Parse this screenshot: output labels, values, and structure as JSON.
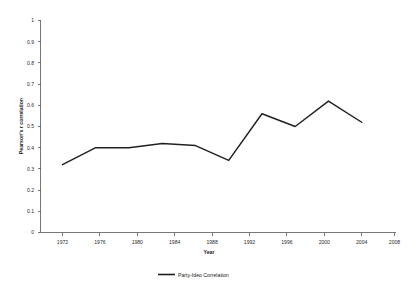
{
  "chart_data": {
    "type": "line",
    "title": "",
    "subtitle": "",
    "xlabel": "Year",
    "ylabel": "Pearson's r correlation",
    "x": [
      1972,
      1976,
      1980,
      1984,
      1988,
      1992,
      1996,
      2000,
      2004,
      2008
    ],
    "xtick_labels": [
      "1972",
      "1976",
      "1980",
      "1984",
      "1988",
      "1992",
      "1996",
      "2000",
      "2004",
      "2008"
    ],
    "ytick_labels": [
      "0",
      "0.1",
      "0.2",
      "0.3",
      "0.4",
      "0.5",
      "0.6",
      "0.7",
      "0.8",
      "0.9",
      "1"
    ],
    "yticks": [
      0,
      0.1,
      0.2,
      0.3,
      0.4,
      0.5,
      0.6,
      0.7,
      0.8,
      0.9,
      1
    ],
    "ylim": [
      0,
      1
    ],
    "xlim": [
      1972,
      2008
    ],
    "grid": false,
    "legend_position": "bottom-center",
    "series": [
      {
        "name": "Party-Ideo Correlation",
        "color": "#231f20",
        "values": [
          0.32,
          0.4,
          0.4,
          0.42,
          0.41,
          0.34,
          0.56,
          0.5,
          0.62,
          0.52
        ]
      }
    ]
  },
  "legend": {
    "entries": [
      {
        "label": "Party-Ideo Correlation"
      }
    ]
  },
  "axes": {
    "x_title": "Year",
    "y_title": "Pearson's r correlation"
  }
}
